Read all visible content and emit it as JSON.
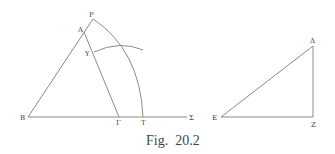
{
  "figure": {
    "caption": "Fig.  20.2",
    "left_diagram": {
      "labels": {
        "P": "P",
        "A": "A",
        "Y": "Y",
        "B": "B",
        "Gamma": "Γ",
        "T": "T",
        "Sigma": "Σ"
      }
    },
    "right_diagram": {
      "labels": {
        "Delta": "Δ",
        "E": "E",
        "Z": "Z"
      }
    }
  }
}
